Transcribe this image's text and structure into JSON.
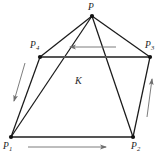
{
  "figure": {
    "type": "geometry-diagram",
    "background_color": "#ffffff",
    "stroke_color": "#1a1a1a",
    "arrow_color": "#6e6e6e",
    "thick_edge_color": "#555555",
    "region_label": "K",
    "caption_text": "",
    "vertices": [
      {
        "name": "P",
        "label": "P",
        "sub": "",
        "x": 92,
        "y": 16,
        "label_x": 88,
        "label_y": 3
      },
      {
        "name": "P1",
        "label": "P",
        "sub": "1",
        "x": 11,
        "y": 137,
        "label_x": 3,
        "label_y": 142
      },
      {
        "name": "P2",
        "label": "P",
        "sub": "2",
        "x": 133,
        "y": 137,
        "label_x": 131,
        "label_y": 142
      },
      {
        "name": "P3",
        "label": "P",
        "sub": "3",
        "x": 150,
        "y": 57,
        "label_x": 145,
        "label_y": 41
      },
      {
        "name": "P4",
        "label": "P",
        "sub": "4",
        "x": 40,
        "y": 57,
        "label_x": 30,
        "label_y": 41
      }
    ],
    "edges": [
      {
        "name": "edge-P-P4",
        "from": "P",
        "to": "P4",
        "weight": "thin"
      },
      {
        "name": "edge-P-P3",
        "from": "P",
        "to": "P3",
        "weight": "thin"
      },
      {
        "name": "edge-P-P1",
        "from": "P",
        "to": "P1",
        "weight": "thin"
      },
      {
        "name": "edge-P-P2",
        "from": "P",
        "to": "P2",
        "weight": "thin"
      },
      {
        "name": "edge-P4-P3",
        "from": "P4",
        "to": "P3",
        "weight": "thick"
      },
      {
        "name": "edge-P4-P1",
        "from": "P4",
        "to": "P1",
        "weight": "thin"
      },
      {
        "name": "edge-P3-P2",
        "from": "P3",
        "to": "P2",
        "weight": "thin"
      },
      {
        "name": "edge-P1-P2",
        "from": "P1",
        "to": "P2",
        "weight": "thick"
      }
    ],
    "arrows": [
      {
        "name": "arrow-top",
        "direction": "left",
        "x1": 116,
        "y1": 47,
        "x2": 70,
        "y2": 47
      },
      {
        "name": "arrow-left",
        "direction": "down",
        "x1": 25,
        "y1": 63,
        "x2": 14,
        "y2": 101
      },
      {
        "name": "arrow-right",
        "direction": "up",
        "x1": 147,
        "y1": 117,
        "x2": 152,
        "y2": 79
      },
      {
        "name": "arrow-bottom",
        "direction": "right",
        "x1": 28,
        "y1": 147,
        "x2": 106,
        "y2": 147
      }
    ]
  }
}
